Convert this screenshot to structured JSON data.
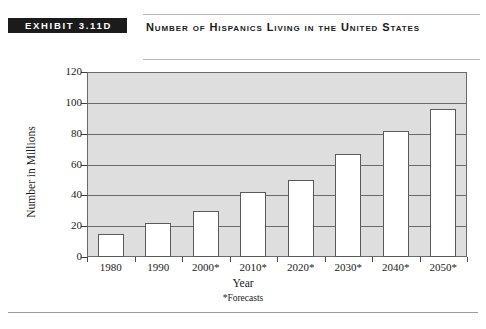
{
  "header": {
    "exhibit_tag": "EXHIBIT 3.11D",
    "title": "Number of Hispanics Living in the United States"
  },
  "chart_data": {
    "type": "bar",
    "title": "Number of Hispanics Living in the United States",
    "xlabel": "Year",
    "ylabel": "Number in Millions",
    "categories": [
      "1980",
      "1990",
      "2000*",
      "2010*",
      "2020*",
      "2030*",
      "2040*",
      "2050*"
    ],
    "values": [
      15,
      22,
      30,
      42,
      50,
      67,
      82,
      96
    ],
    "ylim": [
      0,
      120
    ],
    "yticks": [
      0,
      20,
      40,
      60,
      80,
      100,
      120
    ],
    "ytick_labels": [
      "0",
      "20",
      "40",
      "60",
      "80",
      "100",
      "120"
    ],
    "grid": true,
    "legend": "none",
    "footnote": "*Forecasts",
    "bar_fill_color": "#ffffff",
    "bar_border_color": "#5a5a5a",
    "plot_background_color": "#dedede"
  }
}
